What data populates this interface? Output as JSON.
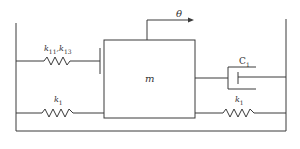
{
  "diagram": {
    "type": "mass-spring-damper",
    "labels": {
      "rotation": "θ",
      "mass": "m",
      "top_spring_k11": "k",
      "top_spring_k11_sub": "11",
      "top_spring_sep": ",",
      "top_spring_k13": "k",
      "top_spring_k13_sub": "13",
      "left_spring": "k",
      "left_spring_sub": "1",
      "right_spring": "k",
      "right_spring_sub": "1",
      "damper": "C",
      "damper_sub": "1"
    },
    "colors": {
      "line": "#3a3a3a",
      "background": "#ffffff"
    }
  }
}
